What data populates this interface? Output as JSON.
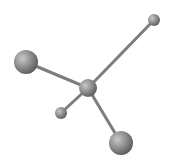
{
  "diagram": {
    "type": "molecule-ball-and-stick",
    "colors": {
      "atom": "#8a8a8a",
      "bond": "#7a7a7a",
      "background": "#ffffff"
    },
    "atoms": [
      {
        "name": "center",
        "x": 88,
        "y": 88,
        "r": 9
      },
      {
        "name": "top-right",
        "x": 154,
        "y": 20,
        "r": 6
      },
      {
        "name": "left",
        "x": 26,
        "y": 62,
        "r": 12
      },
      {
        "name": "lower-left",
        "x": 61,
        "y": 113,
        "r": 6
      },
      {
        "name": "bottom",
        "x": 121,
        "y": 143,
        "r": 12
      }
    ]
  }
}
